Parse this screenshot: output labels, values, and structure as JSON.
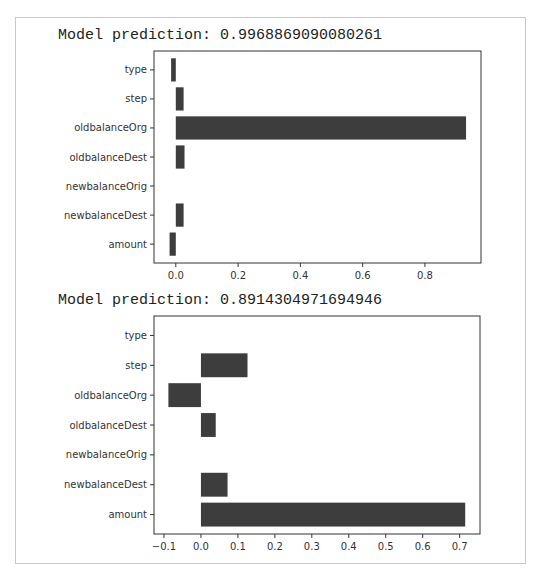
{
  "chart_data": [
    {
      "type": "bar",
      "orientation": "horizontal",
      "title": "Model prediction: 0.9968869090080261",
      "categories": [
        "type",
        "step",
        "oldbalanceOrg",
        "oldbalanceDest",
        "newbalanceOrig",
        "newbalanceDest",
        "amount"
      ],
      "values": [
        -0.015,
        0.025,
        0.932,
        0.028,
        0.0,
        0.025,
        -0.02
      ],
      "xlabel": "",
      "ylabel": "",
      "xlim": [
        -0.07,
        0.98
      ],
      "xticks": [
        0.0,
        0.2,
        0.4,
        0.6,
        0.8
      ],
      "xtick_labels": [
        "0.0",
        "0.2",
        "0.4",
        "0.6",
        "0.8"
      ],
      "grid": false,
      "bar_color": "#3d3d3d"
    },
    {
      "type": "bar",
      "orientation": "horizontal",
      "title": "Model prediction: 0.8914304971694946",
      "categories": [
        "type",
        "step",
        "oldbalanceOrg",
        "oldbalanceDest",
        "newbalanceOrig",
        "newbalanceDest",
        "amount"
      ],
      "values": [
        0.0,
        0.126,
        -0.088,
        0.04,
        0.0,
        0.072,
        0.715
      ],
      "xlabel": "",
      "ylabel": "",
      "xlim": [
        -0.127,
        0.755
      ],
      "xticks": [
        -0.1,
        0.0,
        0.1,
        0.2,
        0.3,
        0.4,
        0.5,
        0.6,
        0.7
      ],
      "xtick_labels": [
        "−0.1",
        "0.0",
        "0.1",
        "0.2",
        "0.3",
        "0.4",
        "0.5",
        "0.6",
        "0.7"
      ],
      "grid": false,
      "bar_color": "#3d3d3d"
    }
  ]
}
